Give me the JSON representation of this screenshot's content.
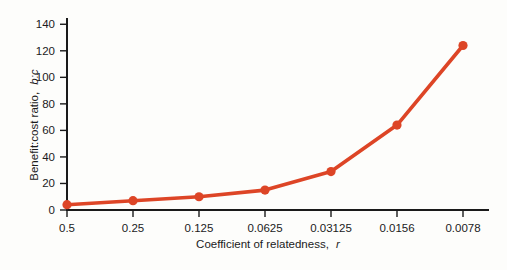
{
  "chart_data": {
    "type": "line",
    "title": "",
    "subtitle": "",
    "xlabel_plain": "Coefficient of relatedness,",
    "xlabel_italic": "r",
    "ylabel_plain": "Benefit:cost ratio,",
    "ylabel_italic": "b:c",
    "categories": [
      "0.5",
      "0.25",
      "0.125",
      "0.0625",
      "0.03125",
      "0.0156",
      "0.0078"
    ],
    "x_numeric": [
      0.5,
      0.25,
      0.125,
      0.0625,
      0.03125,
      0.0156,
      0.0078
    ],
    "values": [
      4,
      7,
      10,
      15,
      29,
      64,
      124
    ],
    "series": [
      {
        "name": "benefit-cost-ratio",
        "values": [
          4,
          7,
          10,
          15,
          29,
          64,
          124
        ],
        "color": "#dd4526",
        "marker": "circle"
      }
    ],
    "yticks": [
      0,
      20,
      40,
      60,
      80,
      100,
      120,
      140
    ],
    "ytick_labels": [
      "0",
      "20",
      "40",
      "60",
      "80",
      "100",
      "120",
      "140"
    ],
    "xtick_labels": [
      "0.5",
      "0.25",
      "0.125",
      "0.0625",
      "0.03125",
      "0.0156",
      "0.0078"
    ],
    "ylim": [
      0,
      150
    ],
    "xlim_note": "categorical-even-spacing-descending-relatedness",
    "grid": false,
    "legend": "none",
    "annotations": []
  },
  "figure": {
    "background_color": "#fdfdfb",
    "axis_color": "#1a1a1a",
    "accent_color": "#dd4526"
  }
}
